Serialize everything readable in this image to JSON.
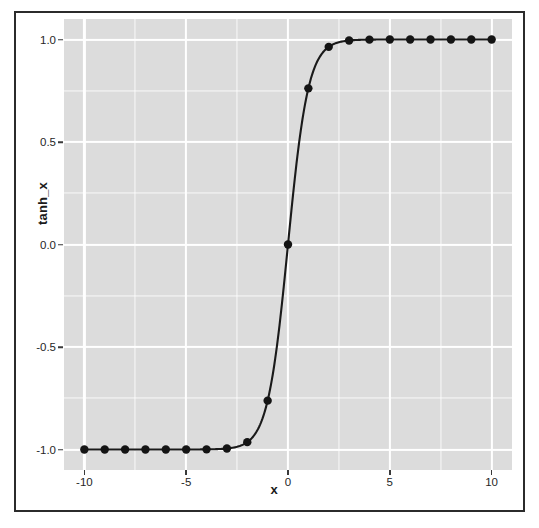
{
  "figure": {
    "background_color": "#ffffff",
    "frame_color": "#2b2b2b",
    "panel_color": "#dcdcdc",
    "gridline_color": "#ffffff",
    "series_color": "#1a1a1a"
  },
  "axes": {
    "x_title": "x",
    "y_title": "tanh_x",
    "x_tick_labels": [
      "-10",
      "-5",
      "0",
      "5",
      "10"
    ],
    "x_tick_values": [
      -10,
      -5,
      0,
      5,
      10
    ],
    "x_minor_values": [
      -7.5,
      -2.5,
      2.5,
      7.5
    ],
    "y_tick_labels": [
      "1.0",
      "0.5",
      "0.0",
      "-0.5",
      "-1.0"
    ],
    "y_tick_values": [
      1.0,
      0.5,
      0.0,
      -0.5,
      -1.0
    ],
    "y_minor_values": [
      0.75,
      0.25,
      -0.25,
      -0.75
    ]
  },
  "chart_data": {
    "type": "line",
    "title": "",
    "subtitle": "",
    "xlabel": "x",
    "ylabel": "tanh_x",
    "xlim": [
      -11,
      11
    ],
    "ylim": [
      -1.1,
      1.1
    ],
    "grid": true,
    "legend": false,
    "legend_position": "none",
    "markers": "filled-circle",
    "annotations": [],
    "x": [
      -10,
      -9,
      -8,
      -7,
      -6,
      -5,
      -4,
      -3,
      -2,
      -1,
      0,
      1,
      2,
      3,
      4,
      5,
      6,
      7,
      8,
      9,
      10
    ],
    "series": [
      {
        "name": "tanh_x",
        "color": "#1a1a1a",
        "values": [
          -1.0,
          -1.0,
          -1.0,
          -1.0,
          -0.99999,
          -0.9999,
          -0.9993,
          -0.99505,
          -0.96403,
          -0.76159,
          0.0,
          0.76159,
          0.96403,
          0.99505,
          0.9993,
          0.9999,
          0.99999,
          1.0,
          1.0,
          1.0,
          1.0
        ]
      }
    ]
  }
}
